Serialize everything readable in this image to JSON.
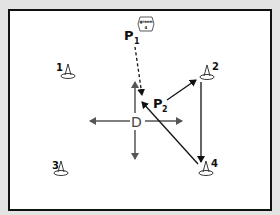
{
  "diagram": {
    "type": "soccer-drill",
    "colors": {
      "background": "#e3e3e3",
      "field": "#ffffff",
      "border": "#111111",
      "arrow_dark": "#111111",
      "arrow_gray": "#555555"
    },
    "ball": {
      "label_line1": "green",
      "label_line2": "4"
    },
    "players": [
      {
        "id": "P1",
        "letter": "P",
        "subscript": "1"
      },
      {
        "id": "P2",
        "letter": "P",
        "subscript": "2"
      },
      {
        "id": "D",
        "letter": "D",
        "subscript": ""
      }
    ],
    "cones": [
      {
        "label": "1"
      },
      {
        "label": "2"
      },
      {
        "label": "3"
      },
      {
        "label": "4"
      }
    ],
    "movements": [
      {
        "from": "P1",
        "to": "center",
        "style": "dashed",
        "meaning": "pass"
      },
      {
        "from": "P2",
        "to": "cone 2",
        "style": "solid"
      },
      {
        "from": "cone 2",
        "to": "cone 4",
        "style": "solid"
      },
      {
        "from": "cone 4",
        "to": "center",
        "style": "solid"
      },
      {
        "from": "D",
        "to": "left",
        "style": "solid"
      },
      {
        "from": "D",
        "to": "right",
        "style": "solid"
      },
      {
        "from": "D",
        "to": "up",
        "style": "solid"
      },
      {
        "from": "D",
        "to": "down",
        "style": "solid"
      }
    ]
  }
}
